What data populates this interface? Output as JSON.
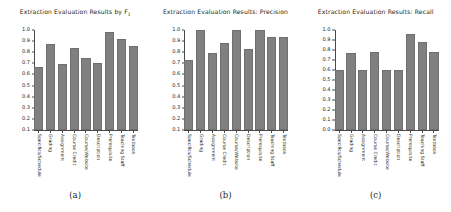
{
  "figure": {
    "categories": [
      "Specifics/Schedule",
      "Grading",
      "Assignment",
      "Course Credit",
      "Course/Website",
      "Description",
      "Prerequisite",
      "Teaching Staff",
      "Textbook"
    ],
    "bar_color": "#808080",
    "axis_color": "#4a4a4a",
    "background": "#ffffff"
  },
  "panels": [
    {
      "caption": "(a)",
      "title_main": "Extraction Evaluation Results by F",
      "title_sub": "1",
      "title_tail": "",
      "yticks": [
        "1.0",
        "0.9",
        "0.8",
        "0.7",
        "0.6",
        "0.5",
        "0.4",
        "0.3",
        "0.2",
        "0.1"
      ]
    },
    {
      "caption": "(b)",
      "title_main": "Extraction Evaluation Results: Precision",
      "title_sub": "",
      "title_tail": "",
      "yticks": [
        "1.0",
        "0.9",
        "0.8",
        "0.7",
        "0.6",
        "0.5",
        "0.4",
        "0.3",
        "0.2",
        "0.1"
      ]
    },
    {
      "caption": "(c)",
      "title_main": "Extraction Evaluation Results: Recall",
      "title_sub": "",
      "title_tail": "",
      "yticks": [
        "1.0",
        "0.9",
        "0.8",
        "0.7",
        "0.6",
        "0.5",
        "0.4",
        "0.3",
        "0.2",
        "0.1",
        "0.0"
      ]
    }
  ],
  "chart_data": [
    {
      "type": "bar",
      "title": "Extraction Evaluation Results by F1",
      "xlabel": "",
      "ylabel": "",
      "ylim": [
        0.1,
        1.0
      ],
      "grid": false,
      "legend": "none",
      "categories": [
        "Specifics/Schedule",
        "Grading",
        "Assignment",
        "Course Credit",
        "Course/Website",
        "Description",
        "Prerequisite",
        "Teaching Staff",
        "Textbook"
      ],
      "values": [
        0.67,
        0.87,
        0.69,
        0.84,
        0.75,
        0.7,
        0.98,
        0.92,
        0.86
      ],
      "ytick_labels": [
        "0.1",
        "0.2",
        "0.3",
        "0.4",
        "0.5",
        "0.6",
        "0.7",
        "0.8",
        "0.9",
        "1.0"
      ]
    },
    {
      "type": "bar",
      "title": "Extraction Evaluation Results: Precision",
      "xlabel": "",
      "ylabel": "",
      "ylim": [
        0.1,
        1.0
      ],
      "grid": false,
      "legend": "none",
      "categories": [
        "Specifics/Schedule",
        "Grading",
        "Assignment",
        "Course Credit",
        "Course/Website",
        "Description",
        "Prerequisite",
        "Teaching Staff",
        "Textbook"
      ],
      "values": [
        0.73,
        1.0,
        0.79,
        0.88,
        1.0,
        0.83,
        1.0,
        0.94,
        0.94
      ],
      "ytick_labels": [
        "0.1",
        "0.2",
        "0.3",
        "0.4",
        "0.5",
        "0.6",
        "0.7",
        "0.8",
        "0.9",
        "1.0"
      ]
    },
    {
      "type": "bar",
      "title": "Extraction Evaluation Results: Recall",
      "xlabel": "",
      "ylabel": "",
      "ylim": [
        0.0,
        1.0
      ],
      "grid": false,
      "legend": "none",
      "categories": [
        "Specifics/Schedule",
        "Grading",
        "Assignment",
        "Course Credit",
        "Course/Website",
        "Description",
        "Prerequisite",
        "Teaching Staff",
        "Textbook"
      ],
      "values": [
        0.6,
        0.77,
        0.6,
        0.78,
        0.6,
        0.6,
        0.96,
        0.88,
        0.78
      ],
      "ytick_labels": [
        "0.0",
        "0.1",
        "0.2",
        "0.3",
        "0.4",
        "0.5",
        "0.6",
        "0.7",
        "0.8",
        "0.9",
        "1.0"
      ]
    }
  ]
}
